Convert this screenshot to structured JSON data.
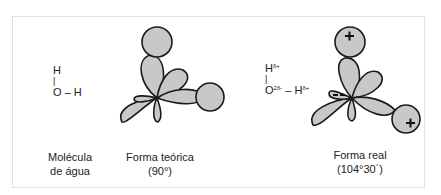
{
  "panels": [
    {
      "id": "molecule",
      "formula": {
        "top": "H",
        "bond": "|",
        "bottom_left": "O",
        "dash": "–",
        "bottom_right": "H"
      },
      "caption_line1": "Molécula",
      "caption_line2": "de água"
    },
    {
      "id": "theoretical",
      "caption_line1": "Forma teórica",
      "caption_line2": "(90°)"
    },
    {
      "id": "real",
      "formula": {
        "top": "H",
        "top_charge": "δ+",
        "bond": "|",
        "bottom_left": "O",
        "bottom_left_charge": "2δ-",
        "dash": "–",
        "bottom_right": "H",
        "bottom_right_charge": "δ+"
      },
      "charges": {
        "top_h": "+",
        "right_h": "+",
        "lone_pair": "−−"
      },
      "caption_line1": "Forma real",
      "caption_line2": "(104°30´)"
    }
  ],
  "colors": {
    "lobe_fill": "#c8c8c8",
    "outline": "#1a1a1a"
  }
}
